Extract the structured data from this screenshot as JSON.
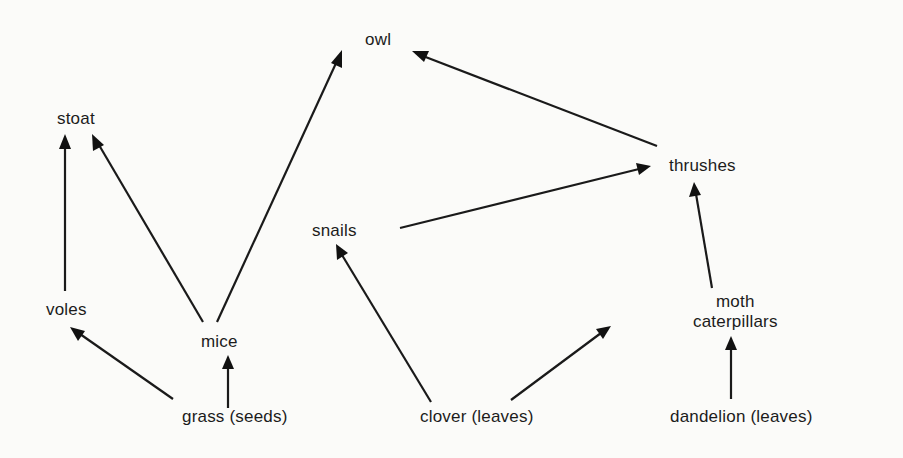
{
  "diagram": {
    "type": "food-web",
    "nodes": {
      "owl": {
        "label": "owl"
      },
      "stoat": {
        "label": "stoat"
      },
      "thrushes": {
        "label": "thrushes"
      },
      "snails": {
        "label": "snails"
      },
      "voles": {
        "label": "voles"
      },
      "mice": {
        "label": "mice"
      },
      "moth_caterpillars": {
        "label_line1": "moth",
        "label_line2": "caterpillars"
      },
      "grass": {
        "label": "grass (seeds)"
      },
      "clover": {
        "label": "clover (leaves)"
      },
      "dandelion": {
        "label": "dandelion (leaves)"
      }
    },
    "edges": [
      {
        "from": "voles",
        "to": "stoat"
      },
      {
        "from": "mice",
        "to": "stoat"
      },
      {
        "from": "mice",
        "to": "owl"
      },
      {
        "from": "thrushes",
        "to": "owl"
      },
      {
        "from": "snails",
        "to": "thrushes"
      },
      {
        "from": "clover (leaves)",
        "to": "snails"
      },
      {
        "from": "clover (leaves)",
        "to": "moth caterpillars"
      },
      {
        "from": "moth caterpillars",
        "to": "thrushes"
      },
      {
        "from": "dandelion (leaves)",
        "to": "moth caterpillars"
      },
      {
        "from": "grass (seeds)",
        "to": "voles"
      },
      {
        "from": "grass (seeds)",
        "to": "mice"
      }
    ]
  }
}
